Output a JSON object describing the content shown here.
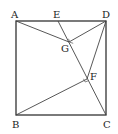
{
  "diagram": {
    "type": "geometry",
    "points": {
      "A": {
        "label": "A",
        "x": 16,
        "y": 21
      },
      "E": {
        "label": "E",
        "x": 58,
        "y": 21
      },
      "D": {
        "label": "D",
        "x": 106,
        "y": 21
      },
      "B": {
        "label": "B",
        "x": 16,
        "y": 115
      },
      "C": {
        "label": "C",
        "x": 106,
        "y": 115
      },
      "G": {
        "label": "G",
        "x": 69,
        "y": 42
      },
      "F": {
        "label": "F",
        "x": 87,
        "y": 79
      }
    },
    "segments": [
      "AB",
      "BC",
      "CD",
      "DA",
      "EC",
      "AG",
      "GD",
      "BF",
      "FD"
    ],
    "right_angles": [
      "G",
      "F"
    ],
    "colors": {
      "stroke": "#333333",
      "background": "#ffffff"
    }
  }
}
